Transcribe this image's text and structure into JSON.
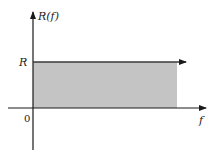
{
  "diagram": {
    "y_axis_label": "R(f)",
    "x_axis_label": "f",
    "level_label": "R",
    "origin_label": "0",
    "colors": {
      "axis": "#1a1a1a",
      "fill": "#c4c4c4",
      "line": "#3a3a3a"
    }
  }
}
